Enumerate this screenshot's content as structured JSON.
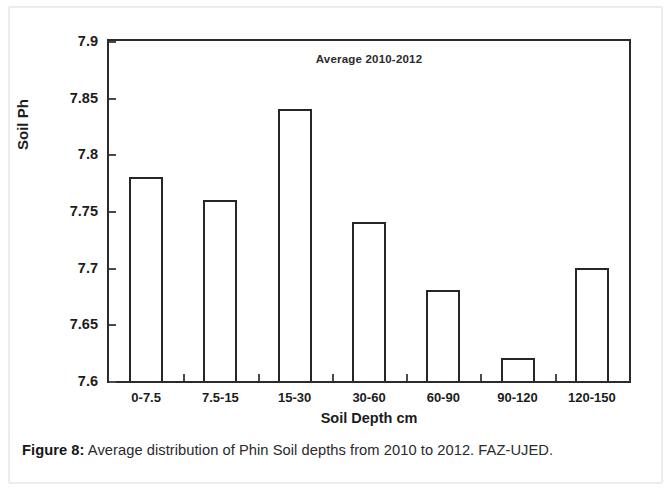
{
  "figure": {
    "caption_label": "Figure 8:",
    "caption_text": " Average distribution of Phin Soil depths from 2010 to 2012. FAZ-UJED."
  },
  "chart_data": {
    "type": "bar",
    "title": "Average 2010-2012",
    "xlabel": "Soil Depth cm",
    "ylabel": "Soil Ph",
    "categories": [
      "0-7.5",
      "7.5-15",
      "15-30",
      "30-60",
      "60-90",
      "90-120",
      "120-150"
    ],
    "values": [
      7.78,
      7.76,
      7.84,
      7.74,
      7.68,
      7.62,
      7.7
    ],
    "ylim": [
      7.6,
      7.9
    ],
    "yticks": [
      7.6,
      7.65,
      7.7,
      7.75,
      7.8,
      7.85,
      7.9
    ],
    "ytick_labels": [
      "7.6",
      "7.65",
      "7.7",
      "7.75",
      "7.8",
      "7.85",
      "7.9"
    ],
    "grid": false,
    "legend": false,
    "bar_fill": "#ffffff",
    "bar_edge": "#262626",
    "axis_color": "#2b2b2b"
  }
}
